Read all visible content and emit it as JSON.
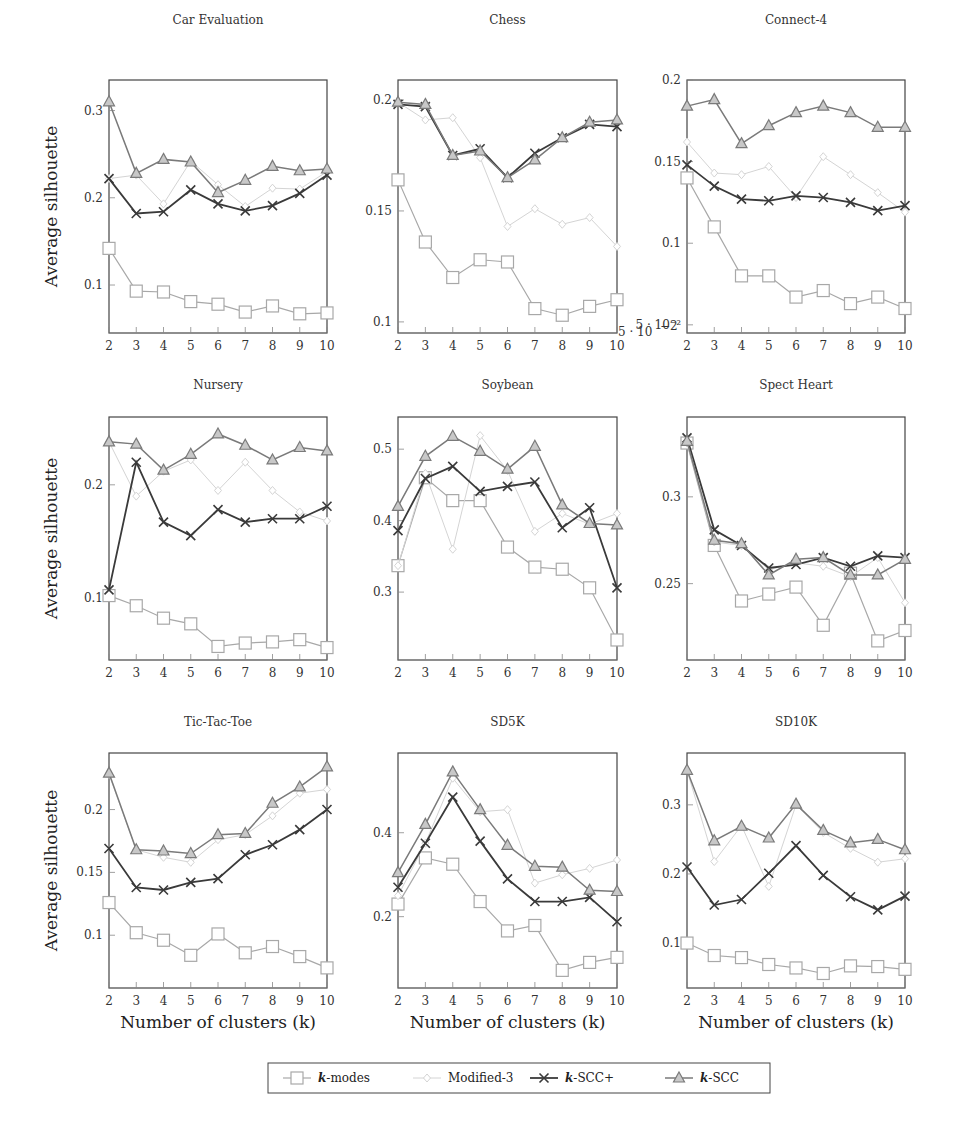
{
  "figure": {
    "ylabel": "Average silhouette",
    "xlabel": "Number of clusters (k)",
    "chess_offset_label": "5 · 10",
    "chess_offset_exp": "−2",
    "connect4_bottom_label": "10",
    "connect4_bottom_exp": "−2"
  },
  "legend": {
    "items": [
      {
        "label": "k-modes",
        "marker": "square",
        "color": "#a8a8a8",
        "width": 1.2
      },
      {
        "label": "Modified-3",
        "marker": "diamond",
        "color": "#d4d4d4",
        "width": 1.0
      },
      {
        "label": "k-SCC+",
        "marker": "cross",
        "color": "#3a3a3a",
        "width": 1.8
      },
      {
        "label": "k-SCC",
        "marker": "triangle",
        "color": "#7a7a7a",
        "width": 1.5
      }
    ]
  },
  "chart_data": [
    {
      "type": "line",
      "title": "Car Evaluation",
      "xlabel": "",
      "ylabel": "Average silhouette",
      "x": [
        2,
        3,
        4,
        5,
        6,
        7,
        8,
        9,
        10
      ],
      "ylim": [
        0.045,
        0.335
      ],
      "yticks": [
        {
          "v": 0.1,
          "t": "0.1"
        },
        {
          "v": 0.2,
          "t": "0.2"
        },
        {
          "v": 0.3,
          "t": "0.3"
        }
      ],
      "series": [
        {
          "name": "k-modes",
          "values": [
            0.142,
            0.093,
            0.092,
            0.081,
            0.078,
            0.069,
            0.076,
            0.067,
            0.068
          ]
        },
        {
          "name": "Modified-3",
          "values": [
            0.222,
            0.226,
            0.193,
            0.242,
            0.215,
            0.19,
            0.211,
            0.21,
            0.23
          ]
        },
        {
          "name": "k-SCC+",
          "values": [
            0.222,
            0.182,
            0.184,
            0.209,
            0.193,
            0.185,
            0.191,
            0.205,
            0.226
          ]
        },
        {
          "name": "k-SCC",
          "values": [
            0.31,
            0.228,
            0.244,
            0.241,
            0.206,
            0.22,
            0.236,
            0.231,
            0.233
          ]
        }
      ]
    },
    {
      "type": "line",
      "title": "Chess",
      "xlabel": "",
      "ylabel": "",
      "x": [
        2,
        3,
        4,
        5,
        6,
        7,
        8,
        9,
        10
      ],
      "ylim": [
        0.095,
        0.209
      ],
      "yticks": [
        {
          "v": 0.1,
          "t": "0.1"
        },
        {
          "v": 0.15,
          "t": "0.15"
        },
        {
          "v": 0.2,
          "t": "0.2"
        }
      ],
      "series": [
        {
          "name": "k-modes",
          "values": [
            0.164,
            0.136,
            0.12,
            0.128,
            0.127,
            0.106,
            0.103,
            0.107,
            0.11
          ]
        },
        {
          "name": "Modified-3",
          "values": [
            0.199,
            0.191,
            0.192,
            0.174,
            0.143,
            0.151,
            0.144,
            0.147,
            0.134
          ]
        },
        {
          "name": "k-SCC+",
          "values": [
            0.198,
            0.197,
            0.175,
            0.178,
            0.165,
            0.176,
            0.183,
            0.189,
            0.188
          ]
        },
        {
          "name": "k-SCC",
          "values": [
            0.199,
            0.198,
            0.175,
            0.177,
            0.165,
            0.173,
            0.183,
            0.19,
            0.191
          ]
        }
      ]
    },
    {
      "type": "line",
      "title": "Connect-4",
      "xlabel": "",
      "ylabel": "",
      "x": [
        2,
        3,
        4,
        5,
        6,
        7,
        8,
        9,
        10
      ],
      "ylim": [
        0.045,
        0.2
      ],
      "yticks": [
        {
          "v": 0.05,
          "t": "5 · 10⁻²"
        },
        {
          "v": 0.1,
          "t": "0.1"
        },
        {
          "v": 0.15,
          "t": "0.15"
        },
        {
          "v": 0.2,
          "t": "0.2"
        }
      ],
      "series": [
        {
          "name": "k-modes",
          "values": [
            0.14,
            0.11,
            0.08,
            0.08,
            0.067,
            0.071,
            0.063,
            0.067,
            0.06
          ]
        },
        {
          "name": "Modified-3",
          "values": [
            0.162,
            0.143,
            0.142,
            0.147,
            0.128,
            0.153,
            0.142,
            0.131,
            0.119
          ]
        },
        {
          "name": "k-SCC+",
          "values": [
            0.148,
            0.135,
            0.127,
            0.126,
            0.129,
            0.128,
            0.125,
            0.12,
            0.123
          ]
        },
        {
          "name": "k-SCC",
          "values": [
            0.184,
            0.188,
            0.161,
            0.172,
            0.18,
            0.184,
            0.18,
            0.171,
            0.171
          ]
        }
      ]
    },
    {
      "type": "line",
      "title": "Nursery",
      "xlabel": "",
      "ylabel": "Average silhouette",
      "x": [
        2,
        3,
        4,
        5,
        6,
        7,
        8,
        9,
        10
      ],
      "ylim": [
        0.045,
        0.26
      ],
      "yticks": [
        {
          "v": 0.1,
          "t": "0.1"
        },
        {
          "v": 0.2,
          "t": "0.2"
        }
      ],
      "series": [
        {
          "name": "k-modes",
          "values": [
            0.102,
            0.093,
            0.082,
            0.077,
            0.057,
            0.06,
            0.061,
            0.063,
            0.056
          ]
        },
        {
          "name": "Modified-3",
          "values": [
            0.238,
            0.19,
            0.212,
            0.222,
            0.195,
            0.22,
            0.195,
            0.176,
            0.168
          ]
        },
        {
          "name": "k-SCC+",
          "values": [
            0.107,
            0.22,
            0.167,
            0.155,
            0.178,
            0.167,
            0.17,
            0.17,
            0.181
          ]
        },
        {
          "name": "k-SCC",
          "values": [
            0.238,
            0.236,
            0.213,
            0.227,
            0.245,
            0.235,
            0.222,
            0.233,
            0.23
          ]
        }
      ]
    },
    {
      "type": "line",
      "title": "Soybean",
      "xlabel": "",
      "ylabel": "",
      "x": [
        2,
        3,
        4,
        5,
        6,
        7,
        8,
        9,
        10
      ],
      "ylim": [
        0.205,
        0.545
      ],
      "yticks": [
        {
          "v": 0.3,
          "t": "0.3"
        },
        {
          "v": 0.4,
          "t": "0.4"
        },
        {
          "v": 0.5,
          "t": "0.5"
        }
      ],
      "series": [
        {
          "name": "k-modes",
          "values": [
            0.337,
            0.46,
            0.428,
            0.428,
            0.363,
            0.335,
            0.332,
            0.306,
            0.233
          ]
        },
        {
          "name": "Modified-3",
          "values": [
            0.337,
            0.466,
            0.36,
            0.519,
            0.47,
            0.385,
            0.41,
            0.395,
            0.41
          ]
        },
        {
          "name": "k-SCC+",
          "values": [
            0.386,
            0.459,
            0.476,
            0.441,
            0.448,
            0.454,
            0.39,
            0.418,
            0.306
          ]
        },
        {
          "name": "k-SCC",
          "values": [
            0.42,
            0.49,
            0.518,
            0.497,
            0.472,
            0.504,
            0.422,
            0.396,
            0.394
          ]
        }
      ]
    },
    {
      "type": "line",
      "title": "Spect Heart",
      "xlabel": "",
      "ylabel": "",
      "x": [
        2,
        3,
        4,
        5,
        6,
        7,
        8,
        9,
        10
      ],
      "ylim": [
        0.206,
        0.346
      ],
      "yticks": [
        {
          "v": 0.25,
          "t": "0.25"
        },
        {
          "v": 0.3,
          "t": "0.3"
        }
      ],
      "series": [
        {
          "name": "k-modes",
          "values": [
            0.331,
            0.272,
            0.24,
            0.244,
            0.248,
            0.226,
            0.256,
            0.217,
            0.223
          ]
        },
        {
          "name": "Modified-3",
          "values": [
            0.331,
            0.274,
            0.272,
            0.258,
            0.262,
            0.26,
            0.254,
            0.265,
            0.239
          ]
        },
        {
          "name": "k-SCC+",
          "values": [
            0.334,
            0.281,
            0.272,
            0.259,
            0.261,
            0.265,
            0.26,
            0.266,
            0.265
          ]
        },
        {
          "name": "k-SCC",
          "values": [
            0.332,
            0.275,
            0.273,
            0.255,
            0.264,
            0.265,
            0.255,
            0.255,
            0.264
          ]
        }
      ]
    },
    {
      "type": "line",
      "title": "Tic-Tac-Toe",
      "xlabel": "Number of clusters (k)",
      "ylabel": "Average silhouette",
      "x": [
        2,
        3,
        4,
        5,
        6,
        7,
        8,
        9,
        10
      ],
      "ylim": [
        0.058,
        0.245
      ],
      "yticks": [
        {
          "v": 0.1,
          "t": "0.1"
        },
        {
          "v": 0.15,
          "t": "0.15"
        },
        {
          "v": 0.2,
          "t": "0.2"
        }
      ],
      "series": [
        {
          "name": "k-modes",
          "values": [
            0.126,
            0.102,
            0.096,
            0.084,
            0.101,
            0.086,
            0.091,
            0.083,
            0.074
          ]
        },
        {
          "name": "Modified-3",
          "values": [
            0.228,
            0.168,
            0.162,
            0.158,
            0.176,
            0.18,
            0.195,
            0.213,
            0.216
          ]
        },
        {
          "name": "k-SCC+",
          "values": [
            0.169,
            0.138,
            0.136,
            0.142,
            0.145,
            0.164,
            0.172,
            0.184,
            0.2
          ]
        },
        {
          "name": "k-SCC",
          "values": [
            0.229,
            0.168,
            0.167,
            0.165,
            0.18,
            0.181,
            0.205,
            0.218,
            0.234
          ]
        }
      ]
    },
    {
      "type": "line",
      "title": "SD5K",
      "xlabel": "Number of clusters (k)",
      "ylabel": "",
      "x": [
        2,
        3,
        4,
        5,
        6,
        7,
        8,
        9,
        10
      ],
      "ylim": [
        0.03,
        0.59
      ],
      "yticks": [
        {
          "v": 0.2,
          "t": "0.2"
        },
        {
          "v": 0.4,
          "t": "0.4"
        }
      ],
      "series": [
        {
          "name": "k-modes",
          "values": [
            0.23,
            0.34,
            0.325,
            0.236,
            0.166,
            0.179,
            0.072,
            0.091,
            0.103
          ]
        },
        {
          "name": "Modified-3",
          "values": [
            0.25,
            0.375,
            0.53,
            0.45,
            0.455,
            0.28,
            0.3,
            0.315,
            0.335
          ]
        },
        {
          "name": "k-SCC+",
          "values": [
            0.27,
            0.375,
            0.485,
            0.38,
            0.29,
            0.236,
            0.236,
            0.246,
            0.188
          ]
        },
        {
          "name": "k-SCC",
          "values": [
            0.305,
            0.42,
            0.545,
            0.455,
            0.37,
            0.32,
            0.318,
            0.263,
            0.26
          ]
        }
      ]
    },
    {
      "type": "line",
      "title": "SD10K",
      "xlabel": "Number of clusters (k)",
      "ylabel": "",
      "x": [
        2,
        3,
        4,
        5,
        6,
        7,
        8,
        9,
        10
      ],
      "ylim": [
        0.035,
        0.375
      ],
      "yticks": [
        {
          "v": 0.1,
          "t": "0.1"
        },
        {
          "v": 0.2,
          "t": "0.2"
        },
        {
          "v": 0.3,
          "t": "0.3"
        }
      ],
      "series": [
        {
          "name": "k-modes",
          "values": [
            0.1,
            0.082,
            0.079,
            0.069,
            0.064,
            0.056,
            0.067,
            0.066,
            0.062
          ]
        },
        {
          "name": "Modified-3",
          "values": [
            0.35,
            0.218,
            0.27,
            0.182,
            0.3,
            0.26,
            0.237,
            0.217,
            0.222
          ]
        },
        {
          "name": "k-SCC+",
          "values": [
            0.21,
            0.155,
            0.163,
            0.201,
            0.241,
            0.198,
            0.167,
            0.148,
            0.168
          ]
        },
        {
          "name": "k-SCC",
          "values": [
            0.35,
            0.248,
            0.269,
            0.252,
            0.301,
            0.263,
            0.245,
            0.25,
            0.235
          ]
        }
      ]
    }
  ]
}
